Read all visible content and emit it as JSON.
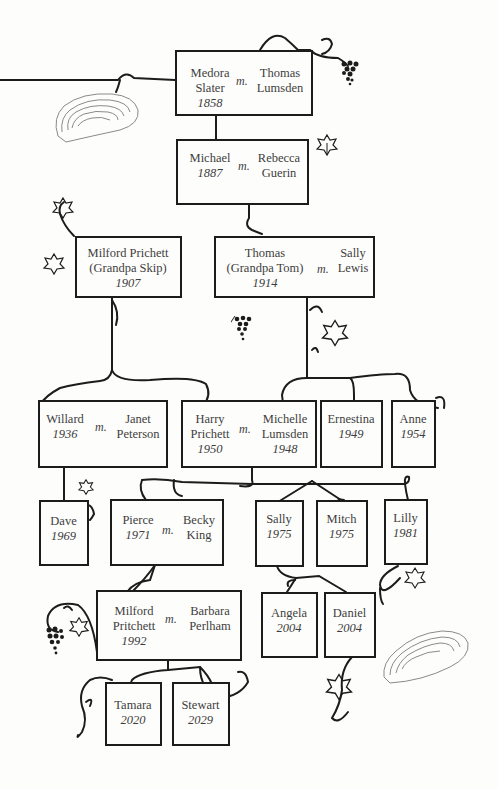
{
  "diagram": {
    "type": "family-tree",
    "marriage_marker": "m.",
    "colors": {
      "line": "#1c1c1c",
      "text": "#3d3d3d",
      "background": "#fdfdfc",
      "oyster": "#8a8a8a"
    }
  },
  "generations": [
    {
      "level": 1,
      "units": [
        {
          "id": "medora-thomas",
          "partner_a": {
            "name": [
              "Medora",
              "Slater"
            ],
            "year": "1858"
          },
          "partner_b": {
            "name": [
              "Thomas",
              "Lumsden"
            ],
            "year": ""
          }
        }
      ]
    },
    {
      "level": 2,
      "units": [
        {
          "id": "michael-rebecca",
          "partner_a": {
            "name": [
              "Michael"
            ],
            "year": "1887"
          },
          "partner_b": {
            "name": [
              "Rebecca",
              "Guerin"
            ],
            "year": ""
          }
        }
      ]
    },
    {
      "level": 3,
      "units": [
        {
          "id": "milford-skip",
          "single": {
            "name": [
              "Milford Prichett",
              "(Grandpa Skip)"
            ],
            "year": "1907"
          }
        },
        {
          "id": "thomas-sally",
          "partner_a": {
            "name": [
              "Thomas",
              "(Grandpa Tom)"
            ],
            "year": "1914"
          },
          "partner_b": {
            "name": [
              "Sally",
              "Lewis"
            ],
            "year": ""
          }
        }
      ]
    },
    {
      "level": 4,
      "units": [
        {
          "id": "willard-janet",
          "partner_a": {
            "name": [
              "Willard"
            ],
            "year": "1936"
          },
          "partner_b": {
            "name": [
              "Janet",
              "Peterson"
            ],
            "year": ""
          }
        },
        {
          "id": "harry-michelle",
          "partner_a": {
            "name": [
              "Harry",
              "Prichett"
            ],
            "year": "1950"
          },
          "partner_b": {
            "name": [
              "Michelle",
              "Lumsden"
            ],
            "year": "1948"
          }
        },
        {
          "id": "ernestina",
          "single": {
            "name": [
              "Ernestina"
            ],
            "year": "1949"
          }
        },
        {
          "id": "anne",
          "single": {
            "name": [
              "Anne"
            ],
            "year": "1954"
          }
        }
      ]
    },
    {
      "level": 5,
      "units": [
        {
          "id": "dave",
          "single": {
            "name": [
              "Dave"
            ],
            "year": "1969"
          }
        },
        {
          "id": "pierce-becky",
          "partner_a": {
            "name": [
              "Pierce"
            ],
            "year": "1971"
          },
          "partner_b": {
            "name": [
              "Becky",
              "King"
            ],
            "year": ""
          }
        },
        {
          "id": "sally",
          "single": {
            "name": [
              "Sally"
            ],
            "year": "1975"
          }
        },
        {
          "id": "mitch",
          "single": {
            "name": [
              "Mitch"
            ],
            "year": "1975"
          }
        },
        {
          "id": "lilly",
          "single": {
            "name": [
              "Lilly"
            ],
            "year": "1981"
          }
        }
      ]
    },
    {
      "level": 6,
      "units": [
        {
          "id": "milford-barbara",
          "partner_a": {
            "name": [
              "Milford",
              "Pritchett"
            ],
            "year": "1992"
          },
          "partner_b": {
            "name": [
              "Barbara",
              "Perlham"
            ],
            "year": ""
          }
        },
        {
          "id": "angela",
          "single": {
            "name": [
              "Angela"
            ],
            "year": "2004"
          }
        },
        {
          "id": "daniel",
          "single": {
            "name": [
              "Daniel"
            ],
            "year": "2004"
          }
        }
      ]
    },
    {
      "level": 7,
      "units": [
        {
          "id": "tamara",
          "single": {
            "name": [
              "Tamara"
            ],
            "year": "2020"
          }
        },
        {
          "id": "stewart",
          "single": {
            "name": [
              "Stewart"
            ],
            "year": "2029"
          }
        }
      ]
    }
  ],
  "decorations": [
    "oyster-shell",
    "grape-cluster",
    "grape-leaf",
    "vine-tendril"
  ]
}
